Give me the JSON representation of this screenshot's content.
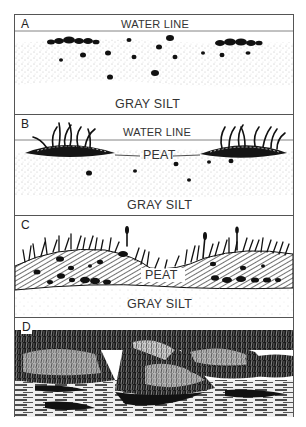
{
  "figure": {
    "type": "stratigraphic-sequence-diagram",
    "panels": [
      {
        "id": "A",
        "letter": "A",
        "labels": {
          "top": "WATER LINE",
          "bottom": "GRAY SILT"
        },
        "description": "Open water over gray silt with scattered dark clumps/pebbles at and below the sediment surface"
      },
      {
        "id": "B",
        "letter": "B",
        "labels": {
          "top": "WATER LINE",
          "middle": "PEAT",
          "bottom": "GRAY SILT"
        },
        "description": "Two floating peat mats with emergent reeds on gray silt"
      },
      {
        "id": "C",
        "letter": "C",
        "labels": {
          "middle": "PEAT",
          "bottom": "GRAY SILT"
        },
        "description": "Thick hatched peat layer with dense vegetation covering the surface above gray silt"
      },
      {
        "id": "D",
        "letter": "D",
        "labels": {},
        "description": "Illustrated landscape of vegetated hummocks surrounded by water"
      }
    ]
  },
  "colors": {
    "ink": "#1a1a1a",
    "frame": "#555555",
    "paper": "#ffffff",
    "silt_dots": "#777777"
  }
}
